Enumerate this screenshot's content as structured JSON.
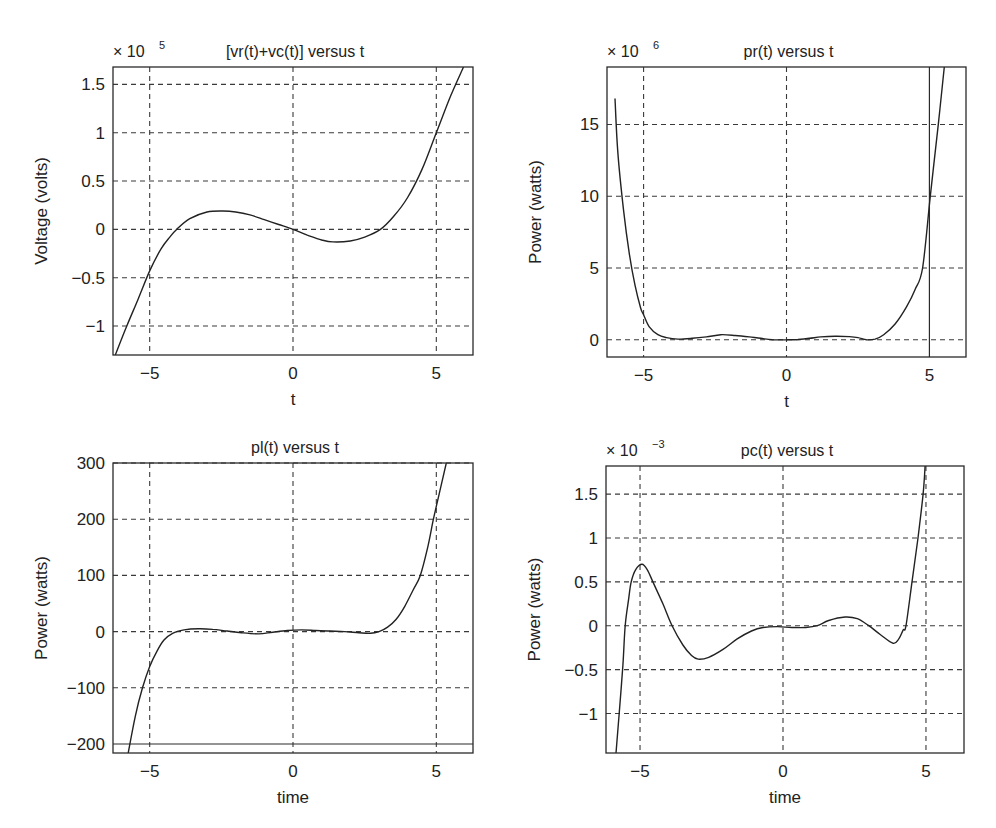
{
  "chart_data": [
    {
      "type": "line",
      "title": "[vr(t)+vc(t)] versus t",
      "xlabel": "t",
      "ylabel": "Voltage (volts)",
      "y_multiplier": "× 10",
      "y_multiplier_exp": "5",
      "xlim": [
        -6.28,
        6.28
      ],
      "ylim": [
        -1.3,
        1.68
      ],
      "xticks": [
        -5,
        0,
        5
      ],
      "xtick_labels": [
        "−5",
        "0",
        "5"
      ],
      "yticks": [
        -1,
        -0.5,
        0,
        0.5,
        1,
        1.5
      ],
      "ytick_labels": [
        "−1",
        "−0.5",
        "0",
        "0.5",
        "1",
        "1.5"
      ],
      "grid": "on",
      "solid_grid_x": [],
      "solid_grid_y": [],
      "series": [
        {
          "name": "vr(t)+vc(t)",
          "x": [
            -6.2,
            -5.8,
            -5.4,
            -5.0,
            -4.6,
            -4.3,
            -4.06,
            -3.6,
            -3.0,
            -2.43,
            -2.0,
            -1.5,
            -1.0,
            -0.5,
            0,
            0.5,
            1.0,
            1.39,
            2.0,
            2.5,
            3.05,
            3.5,
            4.0,
            4.5,
            5.0,
            5.5,
            5.95
          ],
          "y": [
            -1.3,
            -1.0,
            -0.72,
            -0.43,
            -0.2,
            -0.08,
            0.0,
            0.11,
            0.18,
            0.19,
            0.18,
            0.15,
            0.1,
            0.05,
            0.0,
            -0.06,
            -0.11,
            -0.13,
            -0.12,
            -0.08,
            0.0,
            0.13,
            0.33,
            0.62,
            1.0,
            1.38,
            1.68
          ]
        }
      ]
    },
    {
      "type": "line",
      "title": "pr(t) versus t",
      "xlabel": "t",
      "ylabel": "Power (watts)",
      "y_multiplier": "× 10",
      "y_multiplier_exp": "6",
      "xlim": [
        -6.28,
        6.28
      ],
      "ylim": [
        -1.2,
        19.0
      ],
      "xticks": [
        -5,
        0,
        5
      ],
      "xtick_labels": [
        "−5",
        "0",
        "5"
      ],
      "yticks": [
        0,
        5,
        10,
        15
      ],
      "ytick_labels": [
        "0",
        "5",
        "10",
        "15"
      ],
      "grid": "on",
      "solid_grid_x": [
        5
      ],
      "solid_grid_y": [],
      "series": [
        {
          "name": "pr(t)",
          "x": [
            -6.0,
            -5.9,
            -5.7,
            -5.5,
            -5.3,
            -5.1,
            -5.0,
            -4.8,
            -4.5,
            -4.2,
            -3.8,
            -3.3,
            -2.8,
            -2.3,
            -1.8,
            -1.3,
            -0.9,
            -0.5,
            0,
            0.4,
            0.8,
            1.2,
            1.7,
            2.2,
            2.5,
            2.8,
            3.1,
            3.4,
            3.8,
            4.2,
            4.5,
            4.76,
            5.03,
            5.31,
            5.52
          ],
          "y": [
            16.8,
            13.0,
            9.0,
            6.0,
            3.8,
            2.2,
            1.74,
            0.9,
            0.35,
            0.15,
            0.05,
            0.1,
            0.2,
            0.35,
            0.3,
            0.2,
            0.1,
            0.0,
            0.0,
            0.02,
            0.1,
            0.2,
            0.25,
            0.22,
            0.15,
            0.0,
            0.05,
            0.35,
            1.1,
            2.3,
            3.5,
            5.0,
            10.0,
            15.0,
            19.0
          ]
        }
      ]
    },
    {
      "type": "line",
      "title": "pl(t) versus t",
      "xlabel": "time",
      "ylabel": "Power (watts)",
      "y_multiplier": "",
      "y_multiplier_exp": "",
      "xlim": [
        -6.28,
        6.28
      ],
      "ylim": [
        -216,
        300
      ],
      "xticks": [
        -5,
        0,
        5
      ],
      "xtick_labels": [
        "−5",
        "0",
        "5"
      ],
      "yticks": [
        -200,
        -100,
        0,
        100,
        200,
        300
      ],
      "ytick_labels": [
        "−200",
        "−100",
        "0",
        "100",
        "200",
        "300"
      ],
      "grid": "on",
      "solid_grid_x": [],
      "solid_grid_y": [
        -200
      ],
      "series": [
        {
          "name": "pl(t)",
          "x": [
            -5.75,
            -5.5,
            -5.25,
            -5.0,
            -4.75,
            -4.5,
            -4.2,
            -3.8,
            -3.3,
            -2.8,
            -2.3,
            -1.8,
            -1.2,
            -0.7,
            -0.2,
            0.3,
            0.8,
            1.3,
            1.8,
            2.3,
            2.7,
            3.0,
            3.3,
            3.6,
            3.9,
            4.2,
            4.44,
            4.7,
            4.9,
            5.1,
            5.35
          ],
          "y": [
            -216,
            -150,
            -100,
            -62,
            -35,
            -15,
            -3,
            3,
            5,
            4,
            1,
            -2,
            -4,
            -1,
            2,
            3,
            2,
            1,
            0,
            -2,
            -3,
            0,
            8,
            22,
            45,
            75,
            100,
            150,
            200,
            245,
            300
          ]
        }
      ]
    },
    {
      "type": "line",
      "title": "pc(t) versus t",
      "xlabel": "time",
      "ylabel": "Power (watts)",
      "y_multiplier": "× 10",
      "y_multiplier_exp": "−3",
      "xlim": [
        -6.19,
        6.33
      ],
      "ylim": [
        -1.45,
        1.82
      ],
      "xticks": [
        -5,
        0,
        5
      ],
      "xtick_labels": [
        "−5",
        "0",
        "5"
      ],
      "yticks": [
        -1,
        -0.5,
        0,
        0.5,
        1,
        1.5
      ],
      "ytick_labels": [
        "−1",
        "−0.5",
        "0",
        "0.5",
        "1",
        "1.5"
      ],
      "grid": "on",
      "solid_grid_x": [],
      "solid_grid_y": [],
      "series": [
        {
          "name": "pc(t)",
          "x": [
            -5.84,
            -5.73,
            -5.6,
            -5.52,
            -5.4,
            -5.31,
            -5.15,
            -4.93,
            -4.75,
            -4.55,
            -4.2,
            -3.88,
            -3.5,
            -3.2,
            -2.97,
            -2.6,
            -2.1,
            -1.6,
            -1.1,
            -0.7,
            -0.2,
            0.3,
            0.8,
            1.2,
            1.6,
            2.17,
            2.6,
            3.0,
            3.4,
            3.85,
            4.05,
            4.2,
            4.3,
            4.51,
            4.72,
            4.9,
            4.97
          ],
          "y": [
            -1.45,
            -1.0,
            -0.45,
            0.0,
            0.3,
            0.5,
            0.64,
            0.7,
            0.64,
            0.5,
            0.25,
            0.0,
            -0.22,
            -0.34,
            -0.38,
            -0.36,
            -0.27,
            -0.15,
            -0.06,
            -0.02,
            -0.01,
            -0.02,
            -0.02,
            0.0,
            0.06,
            0.1,
            0.08,
            0.0,
            -0.1,
            -0.2,
            -0.15,
            -0.05,
            0.0,
            0.5,
            1.0,
            1.5,
            1.82
          ]
        }
      ]
    }
  ]
}
